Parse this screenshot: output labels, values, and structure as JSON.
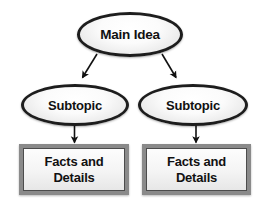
{
  "diagram": {
    "background_color": "#ffffff",
    "node_border_color": "#1d1d1d",
    "box_border_color": "#8a8a8a",
    "text_color": "#111111",
    "nodes": {
      "main_idea": {
        "label": "Main Idea",
        "shape": "ellipse"
      },
      "subtopic_left": {
        "label": "Subtopic",
        "shape": "ellipse"
      },
      "subtopic_right": {
        "label": "Subtopic",
        "shape": "ellipse"
      },
      "facts_left": {
        "line1": "Facts and",
        "line2": "Details",
        "shape": "rectangle"
      },
      "facts_right": {
        "line1": "Facts and",
        "line2": "Details",
        "shape": "rectangle"
      }
    },
    "connectors": [
      {
        "name": "main-idea-to-subtopic-left",
        "from": "main_idea",
        "to": "subtopic_left",
        "style": "arrow"
      },
      {
        "name": "main-idea-to-subtopic-right",
        "from": "main_idea",
        "to": "subtopic_right",
        "style": "arrow"
      },
      {
        "name": "subtopic-left-to-facts-left",
        "from": "subtopic_left",
        "to": "facts_left",
        "style": "arrow"
      },
      {
        "name": "subtopic-right-to-facts-right",
        "from": "subtopic_right",
        "to": "facts_right",
        "style": "arrow"
      }
    ]
  }
}
